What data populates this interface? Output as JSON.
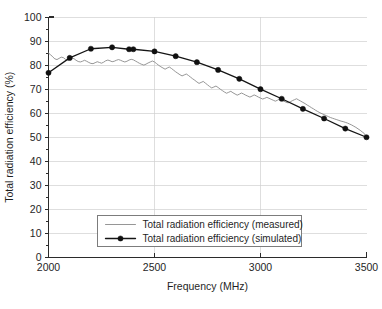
{
  "chart_data": {
    "type": "line",
    "title": "",
    "xlabel": "Frequency (MHz)",
    "ylabel": "Total radiation efficiency (%)",
    "xlim": [
      2000,
      3500
    ],
    "ylim": [
      0,
      100
    ],
    "xticks": [
      2000,
      2500,
      3000,
      3500
    ],
    "yticks": [
      0,
      10,
      20,
      30,
      40,
      50,
      60,
      70,
      80,
      90,
      100
    ],
    "xtick_labels": [
      "2000",
      "2500",
      "3000",
      "3500"
    ],
    "ytick_labels": [
      "0",
      "10",
      "20",
      "30",
      "40",
      "50",
      "60",
      "70",
      "80",
      "90",
      "100"
    ],
    "grid": true,
    "legend_position": "lower center",
    "series": [
      {
        "name": "Total radiation efficiency (measured)",
        "color": "#8a8a8a",
        "marker": "none",
        "x": [
          2000,
          2010,
          2020,
          2030,
          2040,
          2050,
          2060,
          2070,
          2080,
          2090,
          2100,
          2110,
          2120,
          2130,
          2140,
          2150,
          2160,
          2170,
          2180,
          2190,
          2200,
          2210,
          2220,
          2230,
          2240,
          2250,
          2260,
          2270,
          2280,
          2290,
          2300,
          2310,
          2320,
          2330,
          2340,
          2350,
          2360,
          2370,
          2380,
          2390,
          2400,
          2410,
          2420,
          2430,
          2440,
          2450,
          2460,
          2470,
          2480,
          2490,
          2500,
          2510,
          2520,
          2530,
          2540,
          2550,
          2560,
          2570,
          2580,
          2590,
          2600,
          2610,
          2620,
          2630,
          2640,
          2650,
          2660,
          2670,
          2680,
          2690,
          2700,
          2710,
          2720,
          2730,
          2740,
          2750,
          2760,
          2770,
          2780,
          2790,
          2800,
          2810,
          2820,
          2830,
          2840,
          2850,
          2860,
          2870,
          2880,
          2890,
          2900,
          2910,
          2920,
          2930,
          2940,
          2950,
          2960,
          2970,
          2980,
          2990,
          3000,
          3010,
          3020,
          3030,
          3040,
          3050,
          3060,
          3070,
          3080,
          3090,
          3100,
          3110,
          3120,
          3130,
          3140,
          3150,
          3160,
          3170,
          3180,
          3190,
          3200,
          3210,
          3220,
          3230,
          3240,
          3250,
          3260,
          3270,
          3280,
          3290,
          3300,
          3310,
          3320,
          3330,
          3340,
          3350,
          3360,
          3370,
          3380,
          3390,
          3400,
          3410,
          3420,
          3430,
          3440,
          3450,
          3460,
          3470,
          3480,
          3490,
          3500
        ],
        "y": [
          85.0,
          84.3,
          83.4,
          82.6,
          82.3,
          82.8,
          83.3,
          83.1,
          82.4,
          82.0,
          82.4,
          83.0,
          82.7,
          82.0,
          81.5,
          81.3,
          81.6,
          82.0,
          81.6,
          81.1,
          80.7,
          80.6,
          81.0,
          81.4,
          81.1,
          80.8,
          81.2,
          81.8,
          82.1,
          81.8,
          81.4,
          81.6,
          82.0,
          82.3,
          82.0,
          81.6,
          81.3,
          81.6,
          82.1,
          82.4,
          82.2,
          81.7,
          81.2,
          80.7,
          80.3,
          80.0,
          80.4,
          80.9,
          81.3,
          81.7,
          81.3,
          80.6,
          79.9,
          79.3,
          78.8,
          78.3,
          78.8,
          79.2,
          78.6,
          77.9,
          77.2,
          76.6,
          76.0,
          75.5,
          75.9,
          76.3,
          75.7,
          75.0,
          74.3,
          73.7,
          73.0,
          72.4,
          72.8,
          73.2,
          72.5,
          71.8,
          71.1,
          70.5,
          70.9,
          71.3,
          70.7,
          70.0,
          69.4,
          68.8,
          68.3,
          68.7,
          69.1,
          68.5,
          68.0,
          67.5,
          67.9,
          68.4,
          68.0,
          67.5,
          67.1,
          66.7,
          67.1,
          67.6,
          67.2,
          66.7,
          66.3,
          65.9,
          66.2,
          66.6,
          66.2,
          65.8,
          65.4,
          65.0,
          65.4,
          65.9,
          65.5,
          65.0,
          64.6,
          64.3,
          64.7,
          65.2,
          65.6,
          66.0,
          65.5,
          65.0,
          64.5,
          64.0,
          63.4,
          62.9,
          62.3,
          61.8,
          61.2,
          60.7,
          60.2,
          59.8,
          59.4,
          59.0,
          58.6,
          58.2,
          57.9,
          57.6,
          57.3,
          57.0,
          56.7,
          56.5,
          56.2,
          55.9,
          55.5,
          55.1,
          54.6,
          54.1,
          53.5,
          52.9,
          52.2,
          51.5,
          50.0
        ]
      },
      {
        "name": "Total radiation efficiency (simulated)",
        "color": "#151515",
        "marker": "filled-circle",
        "x": [
          2000,
          2100,
          2200,
          2300,
          2380,
          2400,
          2500,
          2600,
          2700,
          2800,
          2900,
          3000,
          3100,
          3200,
          3300,
          3400,
          3500
        ],
        "y": [
          76.8,
          83.0,
          86.8,
          87.4,
          86.6,
          86.6,
          85.7,
          83.7,
          81.2,
          78.0,
          74.3,
          70.0,
          66.0,
          61.8,
          57.8,
          53.6,
          50.0
        ]
      }
    ]
  },
  "legend": {
    "entries": [
      {
        "label": "Total radiation efficiency (measured)",
        "style": "line"
      },
      {
        "label": "Total radiation efficiency (simulated)",
        "style": "line-marker"
      }
    ]
  }
}
